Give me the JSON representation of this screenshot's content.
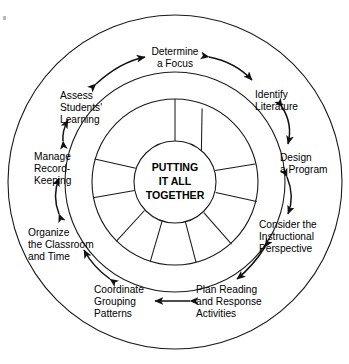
{
  "diagram": {
    "center": {
      "lines": [
        "PUTTING",
        "IT ALL",
        "TOGETHER"
      ]
    },
    "colors": {
      "stroke": "#1a1a1a",
      "arrow": "#111111",
      "text": "#000000",
      "background": "#ffffff"
    },
    "stages": [
      {
        "id": "determine-a-focus",
        "lines": [
          "Determine",
          "a Focus"
        ],
        "anchor": "middle",
        "x": 175,
        "y": 55
      },
      {
        "id": "identify-literature",
        "lines": [
          "Identify",
          "Literature"
        ],
        "anchor": "start",
        "x": 255,
        "y": 98
      },
      {
        "id": "design-a-program",
        "lines": [
          "Design",
          "a Program"
        ],
        "anchor": "start",
        "x": 280,
        "y": 161
      },
      {
        "id": "consider-the-instructional-perspective",
        "lines": [
          "Consider the",
          "Instructional",
          "Perspective"
        ],
        "anchor": "start",
        "x": 259,
        "y": 228
      },
      {
        "id": "plan-reading-and-response-activities",
        "lines": [
          "Plan Reading",
          "and Response",
          "Activities"
        ],
        "anchor": "start",
        "x": 196,
        "y": 293
      },
      {
        "id": "coordinate-grouping-patterns",
        "lines": [
          "Coordinate",
          "Grouping",
          "Patterns"
        ],
        "anchor": "start",
        "x": 94,
        "y": 293
      },
      {
        "id": "organize-the-classroom-and-time",
        "lines": [
          "Organize",
          "the Classroom",
          "and Time"
        ],
        "anchor": "start",
        "x": 28,
        "y": 236
      },
      {
        "id": "manage-record-keeping",
        "lines": [
          "Manage",
          "Record-",
          "Keeping"
        ],
        "anchor": "start",
        "x": 34,
        "y": 160
      },
      {
        "id": "assess-students-learning",
        "lines": [
          "Assess",
          "Students'",
          "Learning"
        ],
        "anchor": "start",
        "x": 60,
        "y": 99
      }
    ],
    "connectors": [
      {
        "id": "assess-to-determine",
        "kind": "double-arrow"
      },
      {
        "id": "determine-to-identify",
        "kind": "double-arrow"
      },
      {
        "id": "identify-to-design",
        "kind": "double-arrow"
      },
      {
        "id": "design-to-consider",
        "kind": "double-arrow"
      },
      {
        "id": "consider-to-plan",
        "kind": "double-arrow"
      },
      {
        "id": "plan-to-coordinate",
        "kind": "double-arrow"
      },
      {
        "id": "coordinate-to-organize",
        "kind": "double-arrow"
      },
      {
        "id": "organize-to-manage",
        "kind": "double-arrow"
      },
      {
        "id": "manage-to-assess",
        "kind": "double-arrow"
      }
    ],
    "geometry": {
      "cx": 175,
      "cy": 182,
      "outer_radius": 167,
      "middle_radius": 110,
      "wheel_outer_radius": 83,
      "wheel_inner_radius": 41,
      "spoke_count": 9
    }
  }
}
